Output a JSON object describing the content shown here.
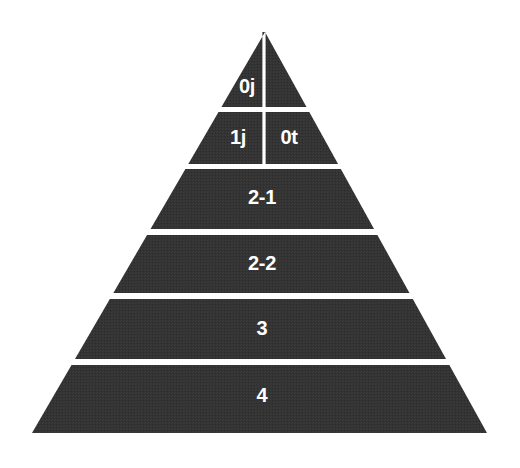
{
  "diagram": {
    "type": "pyramid",
    "shape_name": "segmented-triangle",
    "background_color": "#ffffff",
    "fill_color": "#333333",
    "divider_color": "#ffffff",
    "label_color": "#ffffff",
    "apex": {
      "x": 265,
      "y": 32
    },
    "base": {
      "left_x": 32,
      "right_x": 487,
      "y": 433
    },
    "vertical_divider": {
      "x": 264,
      "top_y": 32,
      "bottom_y": 165
    },
    "tiers": [
      {
        "id": "tier-0",
        "top_y": 32,
        "bottom_y": 107,
        "split": true,
        "cells": [
          {
            "id": "cell-0j",
            "label": "0j",
            "label_x": 247,
            "label_y": 88,
            "font_size": 20
          }
        ]
      },
      {
        "id": "tier-1",
        "top_y": 112,
        "bottom_y": 164,
        "split": true,
        "cells": [
          {
            "id": "cell-1j",
            "label": "1j",
            "label_x": 238,
            "label_y": 139,
            "font_size": 20
          },
          {
            "id": "cell-0t",
            "label": "0t",
            "label_x": 289,
            "label_y": 139,
            "font_size": 20
          }
        ]
      },
      {
        "id": "tier-2",
        "top_y": 169,
        "bottom_y": 229,
        "split": false,
        "cells": [
          {
            "id": "cell-2-1",
            "label": "2-1",
            "label_x": 262,
            "label_y": 199,
            "font_size": 20
          }
        ]
      },
      {
        "id": "tier-3",
        "top_y": 235,
        "bottom_y": 293,
        "split": false,
        "cells": [
          {
            "id": "cell-2-2",
            "label": "2-2",
            "label_x": 262,
            "label_y": 265,
            "font_size": 20
          }
        ]
      },
      {
        "id": "tier-4",
        "top_y": 299,
        "bottom_y": 359,
        "split": false,
        "cells": [
          {
            "id": "cell-3",
            "label": "3",
            "label_x": 262,
            "label_y": 330,
            "font_size": 20
          }
        ]
      },
      {
        "id": "tier-5",
        "top_y": 365,
        "bottom_y": 433,
        "split": false,
        "cells": [
          {
            "id": "cell-4",
            "label": "4",
            "label_x": 262,
            "label_y": 397,
            "font_size": 20
          }
        ]
      }
    ]
  }
}
